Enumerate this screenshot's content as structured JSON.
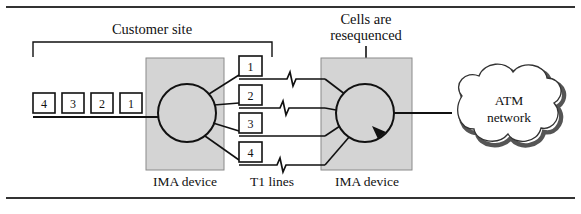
{
  "figure": {
    "title_top": "Customer site",
    "annotation": {
      "line1": "Cells are",
      "line2": "resequenced"
    },
    "cloud_label": {
      "line1": "ATM",
      "line2": "network"
    },
    "captions": {
      "left_device": "IMA device",
      "middle": "T1 lines",
      "right_device": "IMA device"
    },
    "input_cells": [
      {
        "label": "4"
      },
      {
        "label": "3"
      },
      {
        "label": "2"
      },
      {
        "label": "1"
      }
    ],
    "t1_lines": [
      {
        "label": "1",
        "has_impairment": true
      },
      {
        "label": "2",
        "has_impairment": true
      },
      {
        "label": "3",
        "has_impairment": false
      },
      {
        "label": "4",
        "has_impairment": true
      }
    ],
    "colors": {
      "stroke": "#111111",
      "device_fill": "#d4d4d4",
      "device_stroke": "#8a8a8a",
      "cloud_fill": "#ffffff",
      "cloud_shadow": "#555555",
      "rule": "#333333",
      "page_background": "#ffffff"
    }
  }
}
